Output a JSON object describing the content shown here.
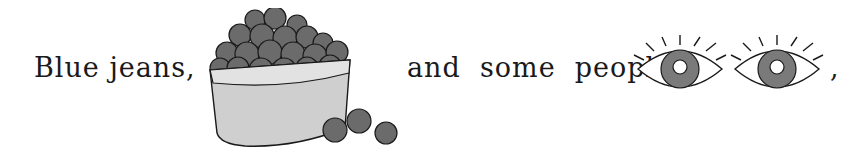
{
  "sentence": {
    "part1": "Blue jeans,",
    "part2": "and  some  people’s",
    "part3": ","
  },
  "images": {
    "basket": "blueberry-basket",
    "eyes": "pair-of-blue-eyes"
  },
  "colors": {
    "berry": "#6b6b6b",
    "basket": "#cfcfcf",
    "iris": "#7a7a7a",
    "outline": "#1a1a1a"
  }
}
